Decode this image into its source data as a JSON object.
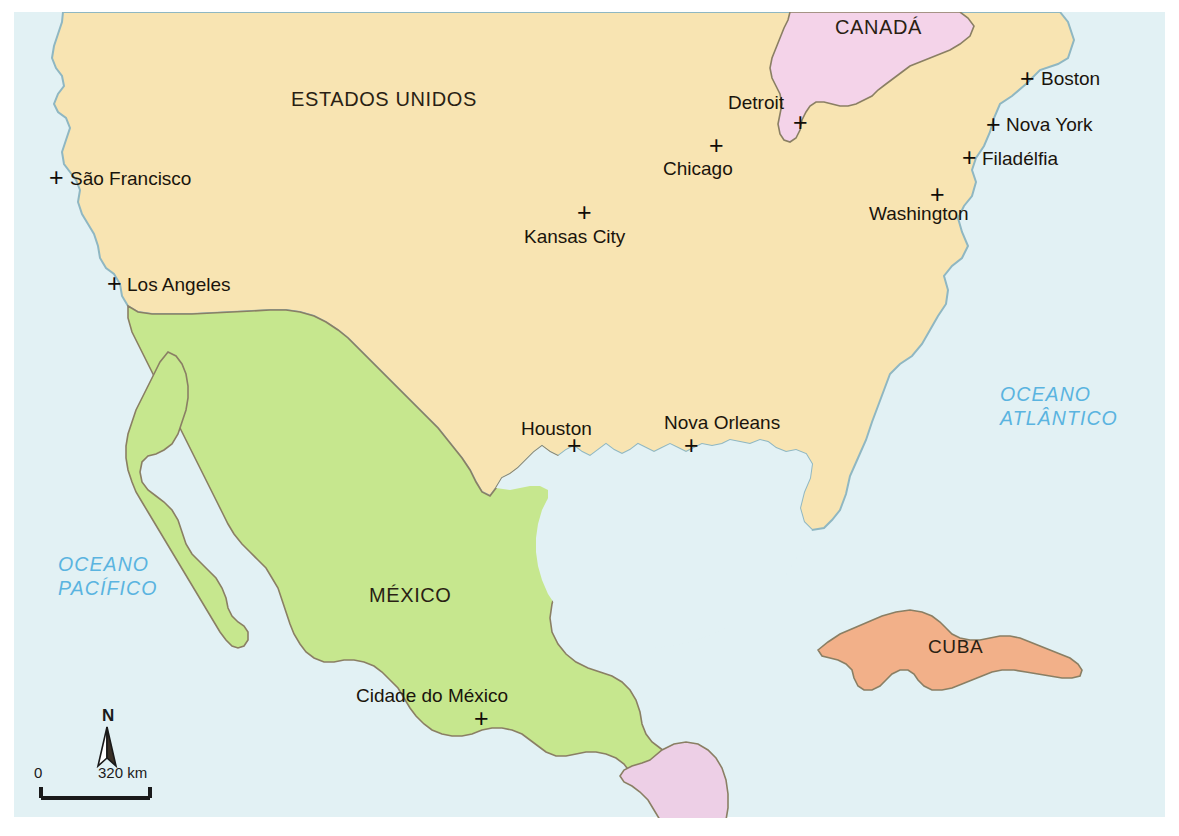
{
  "map": {
    "title": "América do Norte e Central",
    "colors": {
      "ocean": "#e2f1f4",
      "united_states": "#f8e4b2",
      "mexico": "#c6e78e",
      "canada": "#f4d3e9",
      "cuba": "#f2b089",
      "guatemala": "#edcfe6",
      "coastline": "#8fb7c2",
      "border": "#8a7f64",
      "label_text": "#231a10",
      "ocean_text": "#5ab4e0",
      "background": "#ffffff"
    },
    "countries": [
      {
        "id": "united-states",
        "label": "ESTADOS UNIDOS",
        "x": 291,
        "y": 89
      },
      {
        "id": "canada",
        "label": "CANADÁ",
        "x": 835,
        "y": 17
      },
      {
        "id": "mexico",
        "label": "MÉXICO",
        "x": 369,
        "y": 585
      },
      {
        "id": "cuba",
        "label": "CUBA",
        "x": 928,
        "y": 637
      }
    ],
    "cities": [
      {
        "id": "sao-francisco",
        "label": "São Francisco",
        "marker_x": 49,
        "marker_y": 165,
        "label_x": 70,
        "label_y": 169
      },
      {
        "id": "los-angeles",
        "label": "Los Angeles",
        "marker_x": 107,
        "marker_y": 271,
        "label_x": 127,
        "label_y": 275
      },
      {
        "id": "chicago",
        "label": "Chicago",
        "marker_x": 709,
        "marker_y": 133,
        "label_x": 663,
        "label_y": 159
      },
      {
        "id": "detroit",
        "label": "Detroit",
        "marker_x": 793,
        "marker_y": 110,
        "label_x": 728,
        "label_y": 93
      },
      {
        "id": "kansas-city",
        "label": "Kansas City",
        "marker_x": 577,
        "marker_y": 200,
        "label_x": 524,
        "label_y": 227
      },
      {
        "id": "boston",
        "label": "Boston",
        "marker_x": 1020,
        "marker_y": 66,
        "label_x": 1041,
        "label_y": 69
      },
      {
        "id": "nova-york",
        "label": "Nova York",
        "marker_x": 986,
        "marker_y": 112,
        "label_x": 1006,
        "label_y": 115
      },
      {
        "id": "filadelfia",
        "label": "Filadélfia",
        "marker_x": 962,
        "marker_y": 145,
        "label_x": 982,
        "label_y": 149
      },
      {
        "id": "washington",
        "label": "Washington",
        "marker_x": 930,
        "marker_y": 182,
        "label_x": 869,
        "label_y": 204
      },
      {
        "id": "houston",
        "label": "Houston",
        "marker_x": 567,
        "marker_y": 433,
        "label_x": 521,
        "label_y": 419
      },
      {
        "id": "nova-orleans",
        "label": "Nova Orleans",
        "marker_x": 684,
        "marker_y": 433,
        "label_x": 664,
        "label_y": 413
      },
      {
        "id": "cidade-do-mexico",
        "label": "Cidade do México",
        "marker_x": 474,
        "marker_y": 706,
        "label_x": 356,
        "label_y": 686
      }
    ],
    "oceans": [
      {
        "id": "oceano-atlantico",
        "line1": "OCEANO",
        "line2": "ATLÂNTICO",
        "x": 1000,
        "y": 383
      },
      {
        "id": "oceano-pacifico",
        "line1": "OCEANO",
        "line2": "PACÍFICO",
        "x": 58,
        "y": 553
      }
    ],
    "legend": {
      "north_label": "N",
      "scale_min": "0",
      "scale_max": "320 km"
    }
  }
}
